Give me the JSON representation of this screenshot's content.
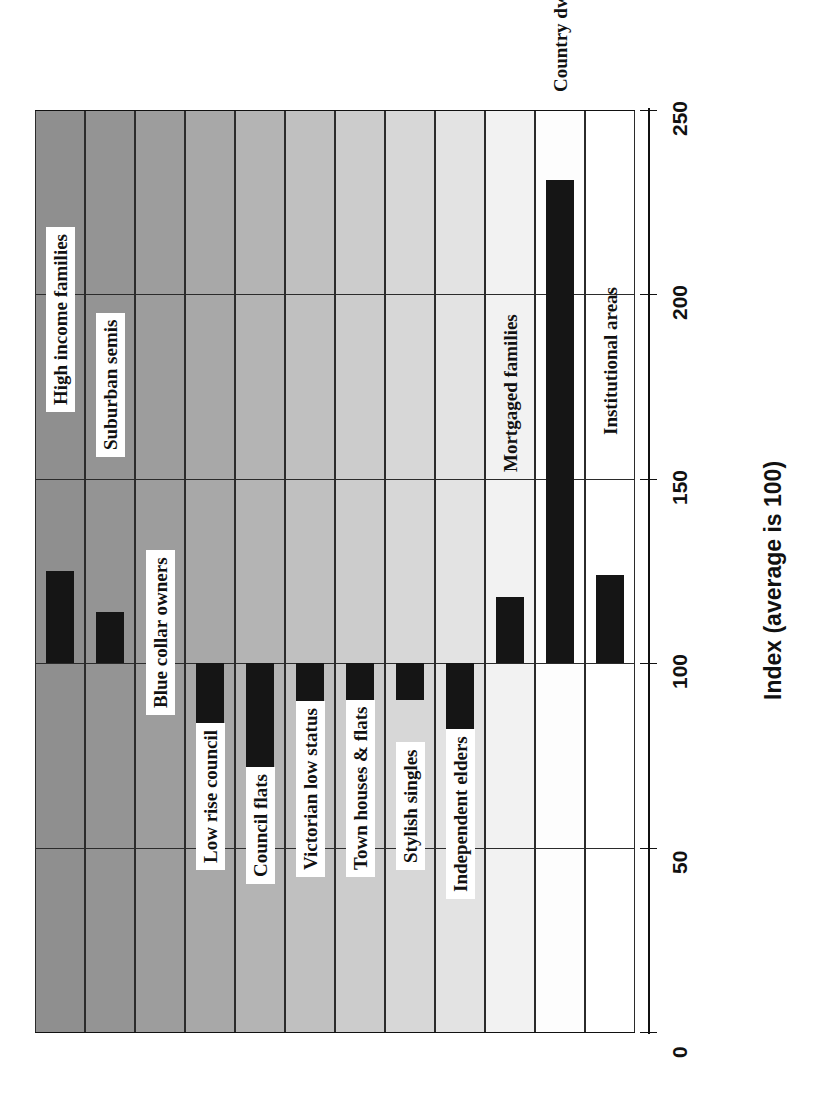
{
  "chart": {
    "type": "bar",
    "orientation": "rotated-90",
    "axis_title": "Index (average is 100)",
    "reference_line_value": 100,
    "ylim": [
      0,
      250
    ],
    "tick_step": 50,
    "grid": true,
    "bar_color": "#151515"
  },
  "ticks": [
    {
      "label": "0",
      "value": 0
    },
    {
      "label": "50",
      "value": 50
    },
    {
      "label": "100",
      "value": 100
    },
    {
      "label": "150",
      "value": 150
    },
    {
      "label": "200",
      "value": 200
    },
    {
      "label": "250",
      "value": 250
    }
  ],
  "chart_data": {
    "type": "bar",
    "title": "",
    "xlabel": "",
    "ylabel": "Index (average is 100)",
    "ylim": [
      0,
      250
    ],
    "baseline": 100,
    "grid": true,
    "legend": "none",
    "categories": [
      "High income families",
      "Suburban semis",
      "Blue collar owners",
      "Low rise council",
      "Council flats",
      "Victorian low status",
      "Town houses & flats",
      "Stylish singles",
      "Independent elders",
      "Mortgaged families",
      "Country dwellers",
      "Institutional areas"
    ],
    "values": [
      125,
      114,
      98,
      50,
      54,
      78,
      89,
      90,
      69,
      118,
      231,
      124
    ]
  },
  "bands": [
    {
      "name": "High income families",
      "shade": "#8f8f8f"
    },
    {
      "name": "Suburban semis",
      "shade": "#949494"
    },
    {
      "name": "Blue collar owners",
      "shade": "#9d9d9d"
    },
    {
      "name": "Low rise council",
      "shade": "#a8a8a8"
    },
    {
      "name": "Council flats",
      "shade": "#b4b4b4"
    },
    {
      "name": "Victorian low status",
      "shade": "#c0c0c0"
    },
    {
      "name": "Town houses & flats",
      "shade": "#cccccc"
    },
    {
      "name": "Stylish singles",
      "shade": "#d7d7d7"
    },
    {
      "name": "Independent elders",
      "shade": "#e3e3e3"
    },
    {
      "name": "Mortgaged families",
      "shade": "#f2f2f2"
    },
    {
      "name": "Country dwellers",
      "shade": "#fdfdfd"
    }
  ],
  "labels": [
    {
      "text": "High income families",
      "plate": true
    },
    {
      "text": "Suburban semis",
      "plate": true
    },
    {
      "text": "Blue collar owners",
      "plate": true
    },
    {
      "text": "Low rise council",
      "plate": true
    },
    {
      "text": "Council flats",
      "plate": true
    },
    {
      "text": "Victorian low status",
      "plate": true
    },
    {
      "text": "Town houses & flats",
      "plate": true
    },
    {
      "text": "Stylish singles",
      "plate": true
    },
    {
      "text": "Independent elders",
      "plate": true
    },
    {
      "text": "Mortgaged families",
      "plate": false
    },
    {
      "text": "Country dwellers",
      "plate": false
    },
    {
      "text": "Institutional areas",
      "plate": false
    }
  ]
}
